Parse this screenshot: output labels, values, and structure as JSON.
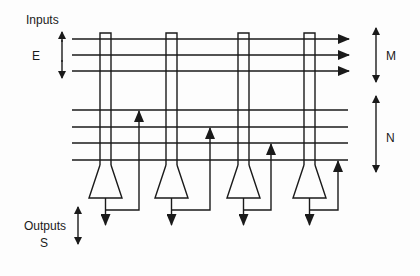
{
  "diagram": {
    "labels": {
      "inputs": "Inputs",
      "e": "E",
      "m": "M",
      "n": "N",
      "outputs": "Outputs",
      "s": "S"
    },
    "stroke_color": "#1a1a1a",
    "background": "#fdfdfd",
    "input_lines_y": [
      39,
      55,
      71
    ],
    "feedback_lines_y": [
      110,
      127,
      143,
      160
    ],
    "columns": [
      {
        "x_left": 100,
        "x_right": 111,
        "feedback_x": 139,
        "feedback_target_y": 110
      },
      {
        "x_left": 166,
        "x_right": 177,
        "feedback_x": 210,
        "feedback_target_y": 127
      },
      {
        "x_left": 238,
        "x_right": 249,
        "feedback_x": 271,
        "feedback_target_y": 143
      },
      {
        "x_left": 304,
        "x_right": 315,
        "feedback_x": 338,
        "feedback_target_y": 160
      }
    ]
  }
}
